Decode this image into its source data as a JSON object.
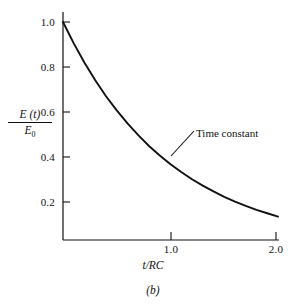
{
  "figure": {
    "panel_label": "(b)",
    "background_color": "#ffffff",
    "ink_color": "#111111"
  },
  "axis": {
    "ylabel_numerator": "E (t)",
    "ylabel_denominator": "E",
    "ylabel_denominator_sub": "0",
    "xlabel": "t/RC",
    "y_ticks": [
      "1.0",
      "0.8",
      "0.6",
      "0.4",
      "0.2"
    ],
    "x_ticks": [
      "1.0",
      "2.0"
    ]
  },
  "annotation": {
    "label": "Time constant"
  },
  "chart_data": {
    "type": "line",
    "title": "",
    "subtitle": "",
    "xlabel": "t/RC",
    "ylabel": "E(t)/E0",
    "xlim": [
      0,
      2.0
    ],
    "ylim": [
      0,
      1.0
    ],
    "xticks": [
      1.0,
      2.0
    ],
    "yticks": [
      0.2,
      0.4,
      0.6,
      0.8,
      1.0
    ],
    "grid": false,
    "legend": null,
    "annotations": [
      {
        "text": "Time constant",
        "points_to_x": 1.0,
        "points_to_y": 0.368
      }
    ],
    "series": [
      {
        "name": "E(t)/E0 = exp(-t/RC)",
        "x": [
          0.0,
          0.1,
          0.2,
          0.3,
          0.4,
          0.5,
          0.6,
          0.7,
          0.8,
          0.9,
          1.0,
          1.1,
          1.2,
          1.3,
          1.4,
          1.5,
          1.6,
          1.7,
          1.8,
          1.9,
          2.0
        ],
        "y": [
          1.0,
          0.905,
          0.819,
          0.741,
          0.67,
          0.607,
          0.549,
          0.497,
          0.449,
          0.407,
          0.368,
          0.333,
          0.301,
          0.273,
          0.247,
          0.223,
          0.202,
          0.183,
          0.165,
          0.15,
          0.135
        ]
      }
    ]
  },
  "layout": {
    "x_origin_px": 63,
    "y_top_px": 22,
    "x_at_1_px": 171,
    "x_at_2_px": 278,
    "y_per_02_px": 45,
    "axis_bottom_px": 240
  }
}
